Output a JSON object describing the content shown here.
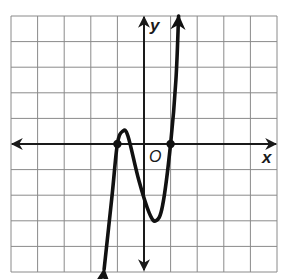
{
  "chart_data": {
    "type": "line",
    "title": "",
    "xlabel": "x",
    "ylabel": "y",
    "origin_label": "O",
    "xlim": [
      -5,
      5
    ],
    "ylim": [
      -5,
      5
    ],
    "grid": true,
    "grid_step": 1,
    "tick_labels": false,
    "series": [
      {
        "name": "polynomial curve",
        "end_behavior": "left end falls (arrow down), right end rises (arrow up)",
        "points": [
          {
            "x": -1.5,
            "y": -4.9
          },
          {
            "x": -1.2,
            "y": -2.0
          },
          {
            "x": -1.0,
            "y": 0.0
          },
          {
            "x": -0.8,
            "y": 0.5
          },
          {
            "x": -0.6,
            "y": 0.3
          },
          {
            "x": -0.2,
            "y": -1.4
          },
          {
            "x": 0.2,
            "y": -2.7
          },
          {
            "x": 0.45,
            "y": -3.0
          },
          {
            "x": 0.7,
            "y": -2.4
          },
          {
            "x": 1.0,
            "y": 0.0
          },
          {
            "x": 1.2,
            "y": 2.5
          },
          {
            "x": 1.3,
            "y": 5.0
          }
        ],
        "marked_points": [
          {
            "x": -1,
            "y": 0
          },
          {
            "x": 1,
            "y": 0
          }
        ]
      }
    ],
    "annotations": [
      "x-intercepts marked with dots at x = -1 and x = 1",
      "local max near (-0.8, 0.5)",
      "local min near (0.45, -3)"
    ]
  },
  "colors": {
    "grid": "#8a8a8a",
    "axis": "#1a1a1a",
    "curve": "#111111",
    "background": "#ffffff"
  }
}
